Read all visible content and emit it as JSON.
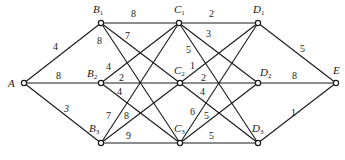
{
  "diagram": {
    "type": "weighted-graph",
    "nodes": [
      {
        "id": "A",
        "label": "A",
        "sub": "",
        "x": 24,
        "y": 83,
        "lx": 8,
        "ly": 87
      },
      {
        "id": "B1",
        "label": "B",
        "sub": "1",
        "x": 101,
        "y": 23,
        "lx": 93,
        "ly": 13
      },
      {
        "id": "B2",
        "label": "B",
        "sub": "2",
        "x": 101,
        "y": 83,
        "lx": 87,
        "ly": 77
      },
      {
        "id": "B3",
        "label": "B",
        "sub": "3",
        "x": 101,
        "y": 143,
        "lx": 89,
        "ly": 132
      },
      {
        "id": "C1",
        "label": "C",
        "sub": "1",
        "x": 179,
        "y": 23,
        "lx": 174,
        "ly": 13
      },
      {
        "id": "C2",
        "label": "C",
        "sub": "2",
        "x": 180,
        "y": 83,
        "lx": 174,
        "ly": 74
      },
      {
        "id": "C3",
        "label": "C",
        "sub": "3",
        "x": 180,
        "y": 143,
        "lx": 174,
        "ly": 132
      },
      {
        "id": "D1",
        "label": "D",
        "sub": "1",
        "x": 258,
        "y": 23,
        "lx": 253,
        "ly": 13
      },
      {
        "id": "D2",
        "label": "D",
        "sub": "2",
        "x": 258,
        "y": 83,
        "lx": 260,
        "ly": 76
      },
      {
        "id": "D3",
        "label": "D",
        "sub": "3",
        "x": 258,
        "y": 143,
        "lx": 252,
        "ly": 132
      },
      {
        "id": "E",
        "label": "E",
        "sub": "",
        "x": 336,
        "y": 83,
        "lx": 333,
        "ly": 74
      }
    ],
    "edges": [
      {
        "from": "A",
        "to": "B1",
        "weight": "4",
        "wx": 53,
        "wy": 50
      },
      {
        "from": "A",
        "to": "B2",
        "weight": "8",
        "wx": 56,
        "wy": 79
      },
      {
        "from": "A",
        "to": "B3",
        "weight": "3",
        "wx": 64,
        "wy": 112
      },
      {
        "from": "B1",
        "to": "C1",
        "weight": "8",
        "wx": 131,
        "wy": 17
      },
      {
        "from": "B1",
        "to": "C2",
        "weight": "7",
        "wx": 125,
        "wy": 39
      },
      {
        "from": "B1",
        "to": "C3",
        "weight": "8",
        "wx": 97,
        "wy": 44
      },
      {
        "from": "B2",
        "to": "C1",
        "weight": "4",
        "wx": 106,
        "wy": 70
      },
      {
        "from": "B2",
        "to": "C2",
        "weight": "2",
        "wx": 119,
        "wy": 81
      },
      {
        "from": "B2",
        "to": "C3",
        "weight": "4",
        "wx": 117,
        "wy": 95
      },
      {
        "from": "B3",
        "to": "C1",
        "weight": "7",
        "wx": 106,
        "wy": 119
      },
      {
        "from": "B3",
        "to": "C2",
        "weight": "8",
        "wx": 124,
        "wy": 119
      },
      {
        "from": "B3",
        "to": "C3",
        "weight": "9",
        "wx": 126,
        "wy": 139
      },
      {
        "from": "C1",
        "to": "D1",
        "weight": "2",
        "wx": 209,
        "wy": 17
      },
      {
        "from": "C1",
        "to": "D2",
        "weight": "3",
        "wx": 206,
        "wy": 37
      },
      {
        "from": "C1",
        "to": "D3",
        "weight": "5",
        "wx": 186,
        "wy": 53
      },
      {
        "from": "C2",
        "to": "D1",
        "weight": "1",
        "wx": 190,
        "wy": 69
      },
      {
        "from": "C2",
        "to": "D2",
        "weight": "2",
        "wx": 201,
        "wy": 81
      },
      {
        "from": "C2",
        "to": "D3",
        "weight": "4",
        "wx": 200,
        "wy": 95
      },
      {
        "from": "C3",
        "to": "D1",
        "weight": "6",
        "wx": 190,
        "wy": 115
      },
      {
        "from": "C3",
        "to": "D2",
        "weight": "5",
        "wx": 204,
        "wy": 119
      },
      {
        "from": "C3",
        "to": "D3",
        "weight": "5",
        "wx": 209,
        "wy": 139
      },
      {
        "from": "D1",
        "to": "E",
        "weight": "5",
        "wx": 300,
        "wy": 52
      },
      {
        "from": "D2",
        "to": "E",
        "weight": "8",
        "wx": 292,
        "wy": 79
      },
      {
        "from": "D3",
        "to": "E",
        "weight": "1",
        "wx": 291,
        "wy": 116
      }
    ]
  }
}
